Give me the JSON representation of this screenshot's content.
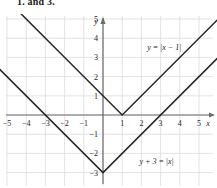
{
  "heading": "1. and 3.",
  "chart_data": {
    "type": "line",
    "title": "",
    "xlabel": "x",
    "ylabel": "y",
    "xlim": [
      -5.9,
      6.0
    ],
    "ylim": [
      -4.0,
      5.9
    ],
    "grid": true,
    "grid_step": 1,
    "xticks": [
      -5,
      -4,
      -3,
      -2,
      -1,
      1,
      2,
      3,
      4,
      5
    ],
    "xtick_labels": [
      "−5",
      "−4",
      "−3",
      "−2",
      "−1",
      "1",
      "2",
      "3",
      "4",
      "5"
    ],
    "yticks": [
      5,
      4,
      3,
      2,
      1,
      -1,
      -2,
      -3
    ],
    "ytick_labels": [
      "5",
      "4",
      "3",
      "2",
      "1",
      "−1",
      "−2",
      "−3"
    ],
    "legend_position": "inline-annotations",
    "series": [
      {
        "name": "y = |x - 1|",
        "label": "y = |x − 1|",
        "label_x": 2.3,
        "label_y": 3.4,
        "vertex": [
          1,
          0
        ],
        "points": [
          [
            -5.0,
            6.0
          ],
          [
            1,
            0
          ],
          [
            6.0,
            5.0
          ]
        ]
      },
      {
        "name": "y + 3 = |x|",
        "label": "y + 3 = |x|",
        "label_x": 1.9,
        "label_y": -2.55,
        "vertex": [
          0,
          -3
        ],
        "points": [
          [
            -5.9,
            2.9
          ],
          [
            0,
            -3
          ],
          [
            6.0,
            3.0
          ]
        ]
      }
    ],
    "annotations": [
      {
        "text": "y = |x − 1|",
        "x": 2.3,
        "y": 3.4
      },
      {
        "text": "y + 3 = |x|",
        "x": 1.9,
        "y": -2.55
      }
    ]
  },
  "axes": {
    "x_axis_name": "x",
    "y_axis_name": "y"
  }
}
